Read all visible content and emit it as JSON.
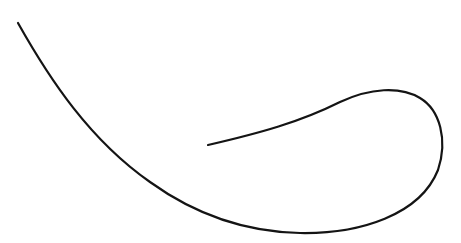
{
  "canvas": {
    "width": 461,
    "height": 243,
    "background": "#ffffff"
  },
  "curve": {
    "stroke": "#141414",
    "stroke_width": 2.2,
    "path": "M18,23 C50,80 90,140 150,182 C200,218 250,232 300,233 C360,234 420,215 438,170 C448,140 440,110 420,98 C400,86 370,88 340,102 C300,122 260,133 208,145"
  }
}
